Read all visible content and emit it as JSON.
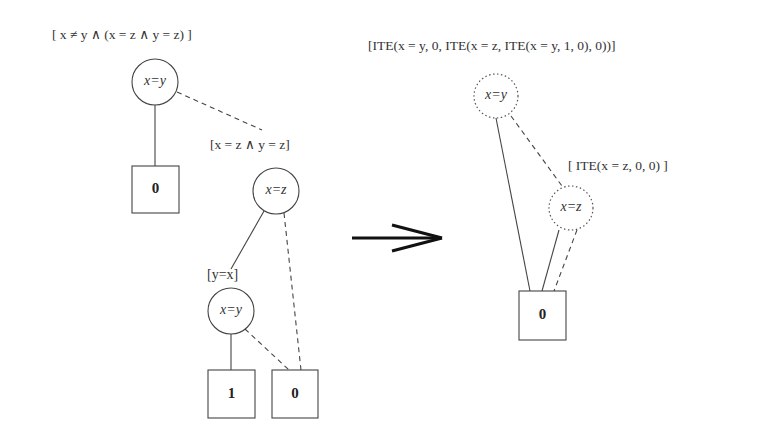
{
  "left_diagram": {
    "root_label": "[ x ≠ y ∧ (x = z ∧ y = z) ]",
    "subtree_label": "[x = z ∧ y = z]",
    "inner_label": "[y=x]",
    "nodes": {
      "root": "x=y",
      "mid": "x=z",
      "inner": "x=y"
    },
    "leaves": {
      "root_leaf": "0",
      "inner_true_leaf": "1",
      "false_leaf": "0"
    }
  },
  "arrow": {
    "symbol": "⟹"
  },
  "right_diagram": {
    "root_label": "[ITE(x = y, 0, ITE(x = z, ITE(x = y, 1, 0), 0))]",
    "subtree_label": "[ ITE(x = z, 0, 0) ]",
    "nodes": {
      "root": "x=y",
      "mid": "x=z"
    },
    "leaves": {
      "shared_leaf": "0"
    }
  }
}
